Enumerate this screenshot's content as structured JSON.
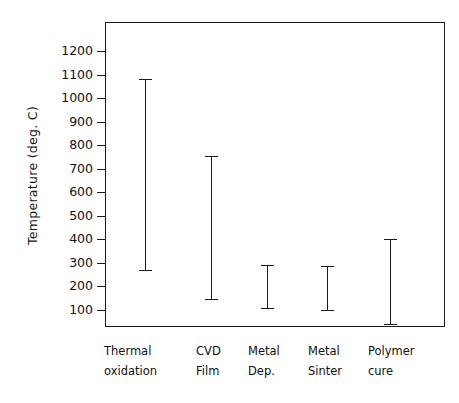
{
  "chart_data": {
    "type": "bar",
    "subtype": "range-bar",
    "title": "",
    "xlabel": "",
    "ylabel": "Temperature (deg. C)",
    "ylim": [
      0,
      1260
    ],
    "grid": false,
    "legend": null,
    "ytick_labels": [
      "1200",
      "1100",
      "1000",
      "900",
      "800",
      "700",
      "600",
      "500",
      "400",
      "300",
      "200",
      "100"
    ],
    "yticks": [
      1200,
      1100,
      1000,
      900,
      800,
      700,
      600,
      500,
      400,
      300,
      200,
      100
    ],
    "categories": [
      "Thermal oxidation",
      "CVD Film",
      "Metal Dep.",
      "Metal Sinter",
      "Polymer cure"
    ],
    "category_lines": [
      [
        "Thermal",
        "oxidation"
      ],
      [
        "CVD",
        "Film"
      ],
      [
        "Metal",
        "Dep."
      ],
      [
        "Metal",
        "Sinter"
      ],
      [
        "Polymer",
        "cure"
      ]
    ],
    "series": [
      {
        "name": "Temperature range",
        "low": [
          270,
          145,
          110,
          100,
          40
        ],
        "high": [
          1080,
          755,
          290,
          285,
          400
        ]
      }
    ],
    "ranges": [
      {
        "category": "Thermal oxidation",
        "min": 270,
        "max": 1080
      },
      {
        "category": "CVD Film",
        "min": 145,
        "max": 755
      },
      {
        "category": "Metal Dep.",
        "min": 110,
        "max": 290
      },
      {
        "category": "Metal Sinter",
        "min": 100,
        "max": 285
      },
      {
        "category": "Polymer cure",
        "min": 40,
        "max": 400
      }
    ],
    "colors": {
      "axis": "#1a1a1a",
      "bar": "#1a1a1a",
      "background": "#ffffff",
      "text": "#111111"
    }
  }
}
